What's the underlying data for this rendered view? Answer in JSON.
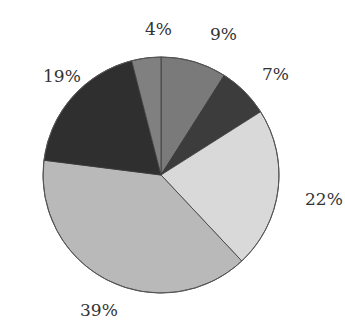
{
  "chart_data": {
    "type": "pie",
    "title": "",
    "start_angle_deg": 0,
    "direction": "clockwise",
    "center": [
      161,
      175
    ],
    "radius": 118,
    "slices": [
      {
        "label": "9%",
        "value": 9,
        "color": "#7a7a7a",
        "label_pos": [
          210,
          40
        ]
      },
      {
        "label": "7%",
        "value": 7,
        "color": "#3c3c3c",
        "label_pos": [
          262,
          80
        ]
      },
      {
        "label": "22%",
        "value": 22,
        "color": "#d9d9d9",
        "label_pos": [
          305,
          205
        ]
      },
      {
        "label": "39%",
        "value": 39,
        "color": "#b9b9b9",
        "label_pos": [
          80,
          316
        ]
      },
      {
        "label": "19%",
        "value": 19,
        "color": "#2f2f2f",
        "label_pos": [
          43,
          82
        ]
      },
      {
        "label": "4%",
        "value": 4,
        "color": "#808080",
        "label_pos": [
          145,
          35
        ]
      }
    ],
    "legend": null
  }
}
